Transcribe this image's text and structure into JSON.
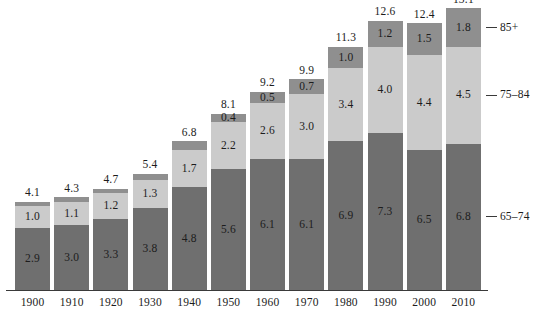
{
  "chart_data": {
    "type": "bar",
    "subtype": "stacked-bar",
    "title": "",
    "subtitle": "",
    "xlabel": "",
    "ylabel": "",
    "grid": false,
    "legend_position": "right-leader-lines",
    "ylim": [
      0,
      13.1
    ],
    "categories": [
      "1900",
      "1910",
      "1920",
      "1930",
      "1940",
      "1950",
      "1960",
      "1970",
      "1980",
      "1990",
      "2000",
      "2010"
    ],
    "series": [
      {
        "name": "65-74",
        "color": "#6f6f6f",
        "values": [
          2.9,
          3.0,
          3.3,
          3.8,
          4.8,
          5.6,
          6.1,
          6.1,
          6.9,
          7.3,
          6.5,
          6.8
        ],
        "labels": [
          "2.9",
          "3.0",
          "3.3",
          "3.8",
          "4.8",
          "5.6",
          "6.1",
          "6.1",
          "6.9",
          "7.3",
          "6.5",
          "6.8"
        ],
        "labels_visible": [
          true,
          true,
          true,
          true,
          true,
          true,
          true,
          true,
          true,
          true,
          true,
          true
        ]
      },
      {
        "name": "75-84",
        "color": "#cbcbcb",
        "values": [
          1.0,
          1.1,
          1.2,
          1.3,
          1.7,
          2.2,
          2.6,
          3.0,
          3.4,
          4.0,
          4.4,
          4.5
        ],
        "labels": [
          "1.0",
          "1.1",
          "1.2",
          "1.3",
          "1.7",
          "2.2",
          "2.6",
          "3.0",
          "3.4",
          "4.0",
          "4.4",
          "4.5"
        ],
        "labels_visible": [
          true,
          true,
          true,
          true,
          true,
          true,
          true,
          true,
          true,
          true,
          true,
          true
        ]
      },
      {
        "name": "85+",
        "color": "#8f8f8f",
        "values": [
          0.2,
          0.2,
          0.2,
          0.3,
          0.4,
          0.4,
          0.5,
          0.7,
          1.0,
          1.2,
          1.5,
          1.8
        ],
        "labels": [
          "",
          "",
          "",
          "",
          "",
          "0.4",
          "0.5",
          "0.7",
          "1.0",
          "1.2",
          "1.5",
          "1.8"
        ],
        "labels_visible": [
          false,
          false,
          false,
          false,
          false,
          true,
          true,
          true,
          true,
          true,
          true,
          true
        ]
      }
    ],
    "totals": [
      4.1,
      4.3,
      4.7,
      5.4,
      6.8,
      8.1,
      9.2,
      9.9,
      11.3,
      12.6,
      12.4,
      13.1
    ],
    "total_labels": [
      "4.1",
      "4.3",
      "4.7",
      "5.4",
      "6.8",
      "8.1",
      "9.2",
      "9.9",
      "11.3",
      "12.6",
      "12.4",
      "13.1"
    ]
  },
  "annotations": {
    "leaders": [
      {
        "label": "85+",
        "series": "85+"
      },
      {
        "label": "75–84",
        "series": "75-84"
      },
      {
        "label": "65–74",
        "series": "65-74"
      }
    ]
  },
  "colors": {
    "seg_65_74": "#6f6f6f",
    "seg_75_84": "#cbcbcb",
    "seg_85_plus": "#8f8f8f",
    "axis": "#3a3a3a",
    "text": "#1c1c1c",
    "background": "#ffffff"
  }
}
